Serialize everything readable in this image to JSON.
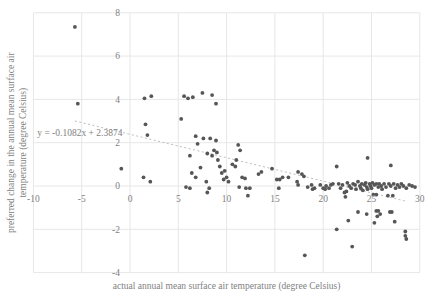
{
  "chart_data": {
    "type": "scatter",
    "title": "",
    "xlabel": "actual annual mean surface air temperature (degree Celsius)",
    "ylabel": "preferred change in the annual mean surface air temperature (degree Celsius)",
    "ylabel_lines": [
      "preferred change in the annual mean surface air",
      "temperature (degree Celsius)"
    ],
    "xlim": [
      -10,
      30
    ],
    "ylim": [
      -4,
      8
    ],
    "xticks": [
      -10,
      -5,
      0,
      5,
      10,
      15,
      20,
      25,
      30
    ],
    "yticks": [
      -4,
      -2,
      0,
      2,
      4,
      6,
      8
    ],
    "grid": true,
    "legend": "none",
    "trendline": {
      "label": "y = -0.1082x + 2.3874",
      "slope": -0.1082,
      "intercept": 2.3874,
      "x_start": -5.7,
      "x_end": 28.6,
      "label_x": -9.6,
      "label_y": 2.3
    },
    "colors": {
      "marker": "#565656",
      "grid": "#e7e7e7",
      "text": "#7f7f7f",
      "trendline": "#bdbdbd",
      "background": "#ffffff"
    },
    "points": [
      [
        -5.7,
        7.35
      ],
      [
        -5.4,
        3.8
      ],
      [
        -0.9,
        0.8
      ],
      [
        1.4,
        0.4
      ],
      [
        2.1,
        0.2
      ],
      [
        1.5,
        4.05
      ],
      [
        2.2,
        4.15
      ],
      [
        1.6,
        2.85
      ],
      [
        1.8,
        2.35
      ],
      [
        5.6,
        4.15
      ],
      [
        6.0,
        4.05
      ],
      [
        6.5,
        4.1
      ],
      [
        7.5,
        4.3
      ],
      [
        8.5,
        4.2
      ],
      [
        8.9,
        3.8
      ],
      [
        5.3,
        3.1
      ],
      [
        6.8,
        2.3
      ],
      [
        7.6,
        2.2
      ],
      [
        8.3,
        2.2
      ],
      [
        8.9,
        2.1
      ],
      [
        7.0,
        1.95
      ],
      [
        6.2,
        1.4
      ],
      [
        7.3,
        0.85
      ],
      [
        8.0,
        1.5
      ],
      [
        8.5,
        1.4
      ],
      [
        8.7,
        1.65
      ],
      [
        9.0,
        1.55
      ],
      [
        9.1,
        1.2
      ],
      [
        9.3,
        0.9
      ],
      [
        10.6,
        1.0
      ],
      [
        10.9,
        0.9
      ],
      [
        11.0,
        1.2
      ],
      [
        11.2,
        1.9
      ],
      [
        11.4,
        1.65
      ],
      [
        5.8,
        -0.05
      ],
      [
        6.2,
        -0.1
      ],
      [
        6.4,
        0.6
      ],
      [
        6.8,
        0.4
      ],
      [
        7.9,
        0.2
      ],
      [
        8.2,
        -0.1
      ],
      [
        8.0,
        -0.3
      ],
      [
        9.5,
        0.6
      ],
      [
        9.8,
        0.7
      ],
      [
        10.0,
        0.4
      ],
      [
        9.7,
        0.3
      ],
      [
        10.2,
        0.2
      ],
      [
        11.6,
        0.4
      ],
      [
        11.9,
        0.35
      ],
      [
        11.3,
        -0.05
      ],
      [
        12.0,
        -0.1
      ],
      [
        12.4,
        -0.1
      ],
      [
        12.2,
        -0.45
      ],
      [
        13.3,
        0.55
      ],
      [
        13.6,
        0.65
      ],
      [
        14.7,
        0.8
      ],
      [
        15.2,
        0.3
      ],
      [
        15.5,
        0.3
      ],
      [
        15.8,
        0.4
      ],
      [
        15.4,
        -0.1
      ],
      [
        16.4,
        0.4
      ],
      [
        17.3,
        0.2
      ],
      [
        17.4,
        0.65
      ],
      [
        17.8,
        0.55
      ],
      [
        18.0,
        0.45
      ],
      [
        17.4,
        0.05
      ],
      [
        18.4,
        -0.05
      ],
      [
        18.8,
        0.05
      ],
      [
        18.9,
        -0.15
      ],
      [
        19.1,
        -0.1
      ],
      [
        19.7,
        0.05
      ],
      [
        20.0,
        -0.1
      ],
      [
        20.2,
        -0.15
      ],
      [
        20.3,
        0.0
      ],
      [
        20.6,
        -0.1
      ],
      [
        20.8,
        0.05
      ],
      [
        21.0,
        0.1
      ],
      [
        21.4,
        0.9
      ],
      [
        24.6,
        1.3
      ],
      [
        27.0,
        0.95
      ],
      [
        21.6,
        0.1
      ],
      [
        21.8,
        -0.1
      ],
      [
        22.0,
        0.05
      ],
      [
        22.2,
        -0.3
      ],
      [
        22.4,
        -0.25
      ],
      [
        22.3,
        -0.5
      ],
      [
        22.5,
        0.15
      ],
      [
        22.7,
        0.0
      ],
      [
        22.9,
        -0.1
      ],
      [
        23.1,
        0.1
      ],
      [
        23.3,
        0.05
      ],
      [
        23.4,
        -0.15
      ],
      [
        23.6,
        0.2
      ],
      [
        23.8,
        0.0
      ],
      [
        23.9,
        -0.1
      ],
      [
        24.0,
        0.1
      ],
      [
        24.1,
        -0.2
      ],
      [
        24.3,
        0.05
      ],
      [
        24.4,
        0.15
      ],
      [
        24.5,
        -0.05
      ],
      [
        24.6,
        -0.15
      ],
      [
        24.8,
        0.1
      ],
      [
        24.9,
        0.0
      ],
      [
        25.0,
        -0.1
      ],
      [
        25.1,
        0.15
      ],
      [
        25.3,
        0.05
      ],
      [
        25.5,
        0.1
      ],
      [
        25.7,
        -0.05
      ],
      [
        25.8,
        0.1
      ],
      [
        26.0,
        0.0
      ],
      [
        26.1,
        -0.15
      ],
      [
        26.3,
        0.1
      ],
      [
        26.5,
        -0.05
      ],
      [
        26.8,
        0.1
      ],
      [
        27.0,
        0.0
      ],
      [
        27.3,
        0.1
      ],
      [
        27.5,
        -0.1
      ],
      [
        27.7,
        0.05
      ],
      [
        27.9,
        -0.05
      ],
      [
        28.1,
        0.1
      ],
      [
        28.3,
        0.0
      ],
      [
        28.6,
        -0.1
      ],
      [
        28.9,
        0.05
      ],
      [
        29.2,
        0.0
      ],
      [
        29.5,
        -0.05
      ],
      [
        25.2,
        -0.4
      ],
      [
        25.5,
        -0.4
      ],
      [
        26.7,
        -0.45
      ],
      [
        27.2,
        -0.45
      ],
      [
        23.6,
        -1.2
      ],
      [
        24.5,
        -1.3
      ],
      [
        25.5,
        -1.15
      ],
      [
        25.7,
        -1.15
      ],
      [
        25.9,
        -1.3
      ],
      [
        25.6,
        -1.4
      ],
      [
        26.9,
        -1.2
      ],
      [
        27.1,
        -1.2
      ],
      [
        22.6,
        -1.6
      ],
      [
        25.3,
        -1.7
      ],
      [
        27.4,
        -1.65
      ],
      [
        21.4,
        -2.0
      ],
      [
        28.5,
        -2.1
      ],
      [
        28.5,
        -2.3
      ],
      [
        28.6,
        -2.45
      ],
      [
        23.0,
        -2.8
      ],
      [
        18.1,
        -3.2
      ]
    ]
  }
}
